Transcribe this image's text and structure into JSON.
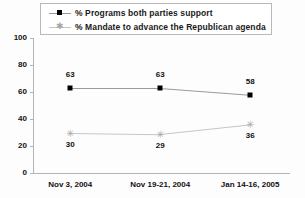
{
  "chart_data": {
    "type": "line",
    "title": "",
    "xlabel": "",
    "ylabel": "",
    "categories": [
      "Nov 3, 2004",
      "Nov 19-21, 2004",
      "Jan 14-16, 2005"
    ],
    "ylim": [
      0,
      100
    ],
    "yticks": [
      0,
      20,
      40,
      60,
      80,
      100
    ],
    "grid": false,
    "legend_position": "top",
    "series": [
      {
        "name": "% Programs both parties support",
        "values": [
          63,
          63,
          58
        ],
        "marker": "square",
        "color": "#000000",
        "line_color": "#9a9a9a",
        "label_position": "above"
      },
      {
        "name": "% Mandate to advance the Republican agenda",
        "values": [
          30,
          29,
          36
        ],
        "marker": "asterisk",
        "color": "#a9a9a9",
        "line_color": "#c6c6c6",
        "label_position": "below"
      }
    ]
  },
  "legend": {
    "items": [
      {
        "label": "% Programs both parties support",
        "marker_icon": "square-marker-icon"
      },
      {
        "label": "% Mandate to advance the Republican agenda",
        "marker_icon": "asterisk-marker-icon"
      }
    ]
  },
  "y_axis": {
    "ticks": [
      "0",
      "20",
      "40",
      "60",
      "80",
      "100"
    ]
  },
  "x_axis": {
    "ticks": [
      "Nov 3, 2004",
      "Nov 19-21, 2004",
      "Jan 14-16, 2005"
    ]
  },
  "data_labels": {
    "series1": [
      "63",
      "63",
      "58"
    ],
    "series2": [
      "30",
      "29",
      "36"
    ]
  }
}
